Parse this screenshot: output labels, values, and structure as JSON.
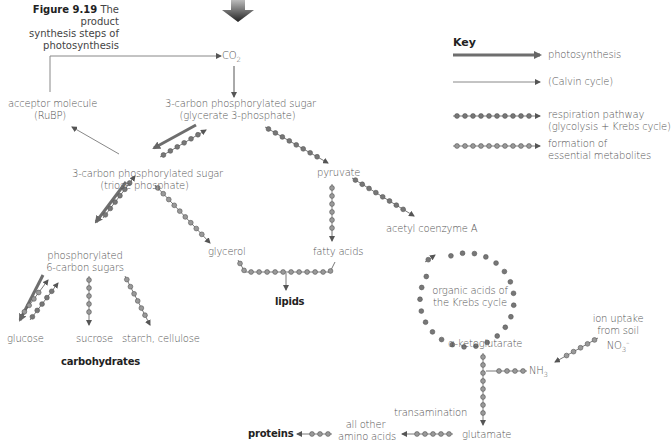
{
  "figure": {
    "number": "Figure 9.19",
    "caption_line1": "The product",
    "caption_line2": "synthesis steps of",
    "caption_line3": "photosynthesis"
  },
  "key": {
    "title": "Key",
    "items": [
      {
        "style": "thick-arrow",
        "label": "photosynthesis"
      },
      {
        "style": "thin-arrow",
        "label": "(Calvin cycle)"
      },
      {
        "style": "dark-beaded-arrow",
        "label_line1": "respiration pathway",
        "label_line2": "(glycolysis + Krebs cycle)"
      },
      {
        "style": "light-beaded-arrow",
        "label_line1": "formation of",
        "label_line2": "essential metabolites"
      }
    ]
  },
  "nodes": {
    "co2": {
      "base": "CO",
      "sub": "2"
    },
    "acceptor": {
      "line1": "acceptor molecule",
      "line2": "(RuBP)"
    },
    "g3p": {
      "line1": "3-carbon phosphorylated sugar",
      "line2": "(glycerate 3-phosphate)"
    },
    "triose": {
      "line1": "3-carbon phosphorylated sugar",
      "line2": "(triose phosphate)"
    },
    "pyruvate": "pyruvate",
    "hexose": {
      "line1": "phosphorylated",
      "line2": "6-carbon sugars"
    },
    "glycerol": "glycerol",
    "fatty_acids": "fatty acids",
    "acetyl_coa": "acetyl coenzyme A",
    "lipids": "lipids",
    "krebs": {
      "line1": "organic acids of",
      "line2": "the Krebs cycle"
    },
    "glucose": "glucose",
    "sucrose": "sucrose",
    "starch": "starch, cellulose",
    "carbohydrates": "carbohydrates",
    "akg": "α-ketoglutarate",
    "ion_uptake": {
      "line1": "ion uptake",
      "line2": "from soil",
      "base": "NO",
      "sub": "3",
      "sup": "–"
    },
    "nh3": {
      "base": "NH",
      "sub": "3"
    },
    "transamination": "transamination",
    "glutamate": "glutamate",
    "other_aa": {
      "line1": "all other",
      "line2": "amino acids"
    },
    "proteins": "proteins"
  },
  "colors": {
    "thick_arrow": "#6e6e6e",
    "thin_arrow": "#8a8a8a",
    "bead_dark": "#777777",
    "bead_light": "#9a9a9a",
    "text": "#555555"
  }
}
